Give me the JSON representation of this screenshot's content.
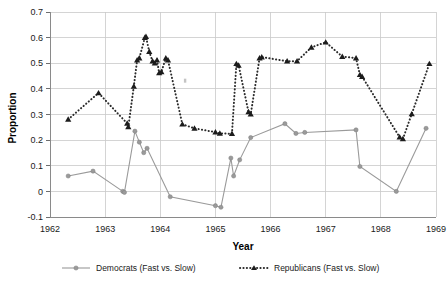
{
  "chart_data": {
    "type": "line",
    "title": "",
    "xlabel": "Year",
    "ylabel": "Proportion",
    "xlim": [
      1962,
      1969
    ],
    "ylim": [
      -0.1,
      0.7
    ],
    "x_ticks": [
      "1962",
      "1963",
      "1964",
      "1965",
      "1966",
      "1967",
      "1968",
      "1969"
    ],
    "y_ticks": [
      "0.7",
      "0.6",
      "0.5",
      "0.4",
      "0.3",
      "0.2",
      "0.1",
      "0",
      "-0.1"
    ],
    "grid": true,
    "legend_position": "bottom",
    "series": [
      {
        "name": "Democrats (Fast vs. Slow)",
        "style": "solid-gray-circle",
        "color": "#9a9a9a",
        "points": [
          [
            1962.33,
            0.06
          ],
          [
            1962.78,
            0.079
          ],
          [
            1963.32,
            0.0
          ],
          [
            1963.35,
            -0.004
          ],
          [
            1963.54,
            0.235
          ],
          [
            1963.62,
            0.192
          ],
          [
            1963.7,
            0.151
          ],
          [
            1963.76,
            0.168
          ],
          [
            1964.18,
            -0.021
          ],
          [
            1965.0,
            -0.056
          ],
          [
            1965.1,
            -0.062
          ],
          [
            1965.28,
            0.13
          ],
          [
            1965.33,
            0.06
          ],
          [
            1965.44,
            0.123
          ],
          [
            1965.64,
            0.21
          ],
          [
            1966.26,
            0.264
          ],
          [
            1966.46,
            0.226
          ],
          [
            1966.62,
            0.23
          ],
          [
            1967.55,
            0.24
          ],
          [
            1967.62,
            0.097
          ],
          [
            1968.28,
            0.0
          ],
          [
            1968.82,
            0.246
          ]
        ]
      },
      {
        "name": "Republicans (Fast vs. Slow)",
        "style": "dotted-black-triangle",
        "color": "#1c1c1c",
        "points": [
          [
            1962.33,
            0.281
          ],
          [
            1962.88,
            0.384
          ],
          [
            1963.4,
            0.265
          ],
          [
            1963.42,
            0.252
          ],
          [
            1963.52,
            0.41
          ],
          [
            1963.58,
            0.512
          ],
          [
            1963.62,
            0.52
          ],
          [
            1963.72,
            0.6
          ],
          [
            1963.74,
            0.604
          ],
          [
            1963.8,
            0.545
          ],
          [
            1963.86,
            0.508
          ],
          [
            1963.9,
            0.5
          ],
          [
            1963.94,
            0.512
          ],
          [
            1963.98,
            0.462
          ],
          [
            1964.02,
            0.466
          ],
          [
            1964.1,
            0.52
          ],
          [
            1964.14,
            0.512
          ],
          [
            1964.4,
            0.262
          ],
          [
            1964.62,
            0.246
          ],
          [
            1965.0,
            0.231
          ],
          [
            1965.08,
            0.226
          ],
          [
            1965.3,
            0.225
          ],
          [
            1965.38,
            0.498
          ],
          [
            1965.42,
            0.492
          ],
          [
            1965.6,
            0.31
          ],
          [
            1965.64,
            0.301
          ],
          [
            1965.8,
            0.52
          ],
          [
            1965.84,
            0.524
          ],
          [
            1966.3,
            0.508
          ],
          [
            1966.48,
            0.508
          ],
          [
            1966.74,
            0.562
          ],
          [
            1967.0,
            0.582
          ],
          [
            1967.3,
            0.526
          ],
          [
            1967.55,
            0.52
          ],
          [
            1967.62,
            0.455
          ],
          [
            1967.66,
            0.448
          ],
          [
            1968.34,
            0.212
          ],
          [
            1968.4,
            0.205
          ],
          [
            1968.56,
            0.302
          ],
          [
            1968.88,
            0.498
          ]
        ]
      }
    ],
    "stray_marker": {
      "x": 1964.45,
      "y": 0.432
    }
  },
  "legend": {
    "entries": [
      {
        "label": "Democrats (Fast vs. Slow)"
      },
      {
        "label": "Republicans (Fast vs. Slow)"
      }
    ]
  }
}
